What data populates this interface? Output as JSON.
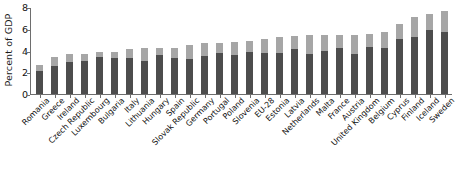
{
  "chart_data": {
    "type": "bar",
    "stacked": true,
    "title": "",
    "subtitle": "",
    "xlabel": "",
    "ylabel": "Percent of GDP",
    "ylim": [
      0,
      8
    ],
    "yticks": [
      0,
      2,
      4,
      6,
      8
    ],
    "ytick_labels": [
      "0",
      "2",
      "4",
      "6",
      "8"
    ],
    "grid": false,
    "legend": "none",
    "categories": [
      "Romania",
      "Greece",
      "Ireland",
      "Czech Republic",
      "Luxembourg",
      "Bulgaria",
      "Italy",
      "Lithuania",
      "Hungary",
      "Spain",
      "Slovak Republic",
      "Germany",
      "Portugal",
      "Poland",
      "Slovenia",
      "EU-28",
      "Estonia",
      "Latvia",
      "Netherlands",
      "Malta",
      "France",
      "Austria",
      "United Kingdom",
      "Belgium",
      "Cyprus",
      "Finland",
      "Iceland",
      "Sweden"
    ],
    "series": [
      {
        "name": "lower-segment",
        "color": "#4d4d4d",
        "values": [
          2.1,
          2.6,
          2.9,
          3.0,
          3.4,
          3.3,
          3.3,
          3.0,
          3.6,
          3.3,
          3.2,
          3.5,
          3.8,
          3.6,
          3.9,
          3.8,
          3.8,
          4.1,
          3.7,
          4.0,
          4.2,
          3.7,
          4.3,
          4.2,
          5.1,
          5.2,
          5.9,
          5.7
        ]
      },
      {
        "name": "upper-segment",
        "color": "#a6a6a6",
        "values": [
          0.6,
          0.8,
          0.8,
          0.7,
          0.5,
          0.6,
          0.8,
          1.2,
          0.6,
          0.9,
          1.3,
          1.2,
          0.9,
          1.2,
          1.0,
          1.3,
          1.4,
          1.2,
          1.7,
          1.4,
          1.2,
          1.7,
          1.2,
          1.5,
          1.3,
          1.9,
          1.5,
          1.9
        ]
      }
    ],
    "totals": [
      2.7,
      3.4,
      3.7,
      3.7,
      3.9,
      3.9,
      4.1,
      4.2,
      4.2,
      4.2,
      4.5,
      4.7,
      4.7,
      4.8,
      4.9,
      5.1,
      5.2,
      5.3,
      5.4,
      5.4,
      5.4,
      5.4,
      5.5,
      5.7,
      6.4,
      7.1,
      7.4,
      7.6
    ],
    "colors": {
      "lower": "#4d4d4d",
      "upper": "#a6a6a6",
      "axis": "#6e6e6e",
      "text": "#111111",
      "background": "#ffffff"
    }
  }
}
